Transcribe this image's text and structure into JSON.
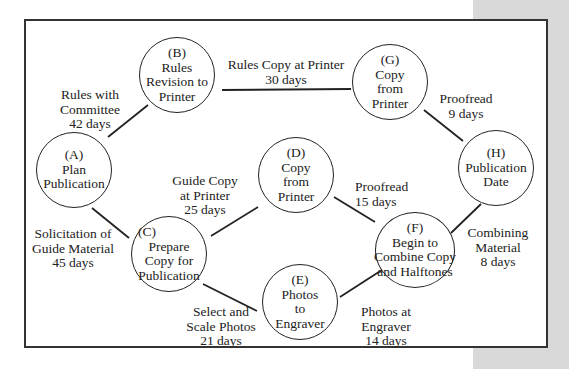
{
  "colors": {
    "line": "#222222",
    "panel": "#d9d9d9",
    "background": "#ffffff"
  },
  "nodes": [
    {
      "id": "A",
      "lines": [
        "(A)",
        "Plan",
        "Publication"
      ],
      "cx": 74,
      "cy": 170
    },
    {
      "id": "B",
      "lines": [
        "(B)",
        "Rules",
        "Revision to",
        "Printer"
      ],
      "cx": 177,
      "cy": 75
    },
    {
      "id": "C",
      "lines": [
        "(C)",
        "Prepare",
        "Copy for",
        "Publication"
      ],
      "cx": 169,
      "cy": 254
    },
    {
      "id": "D",
      "lines": [
        "(D)",
        "Copy",
        "from",
        "Printer"
      ],
      "cx": 296,
      "cy": 175
    },
    {
      "id": "E",
      "lines": [
        "(E)",
        "Photos",
        "to",
        "Engraver"
      ],
      "cx": 300,
      "cy": 302
    },
    {
      "id": "F",
      "lines": [
        "(F)",
        "Begin to",
        "Combine Copy",
        "and Halftones"
      ],
      "cx": 414,
      "cy": 250
    },
    {
      "id": "G",
      "lines": [
        "(G)",
        "Copy",
        "from",
        "Printer"
      ],
      "cx": 390,
      "cy": 82
    },
    {
      "id": "H",
      "lines": [
        "(H)",
        "Publication",
        "Date"
      ],
      "cx": 496,
      "cy": 168
    }
  ],
  "edges": [
    {
      "from": "A",
      "to": "B",
      "activity": [
        "Rules with",
        "Committee"
      ],
      "duration": "42 days"
    },
    {
      "from": "B",
      "to": "G",
      "activity": [
        "Rules Copy at Printer"
      ],
      "duration": "30 days"
    },
    {
      "from": "G",
      "to": "H",
      "activity": [
        "Proofread"
      ],
      "duration": "9 days"
    },
    {
      "from": "A",
      "to": "C",
      "activity": [
        "Solicitation of",
        "Guide Material"
      ],
      "duration": "45 days"
    },
    {
      "from": "C",
      "to": "D",
      "activity": [
        "Guide Copy",
        "at Printer"
      ],
      "duration": "25 days"
    },
    {
      "from": "D",
      "to": "F",
      "activity": [
        "Proofread"
      ],
      "duration": "15 days"
    },
    {
      "from": "C",
      "to": "E",
      "activity": [
        "Select and",
        "Scale Photos"
      ],
      "duration": "21 days"
    },
    {
      "from": "E",
      "to": "F",
      "activity": [
        "Photos at",
        "Engraver"
      ],
      "duration": "14 days"
    },
    {
      "from": "F",
      "to": "H",
      "activity": [
        "Combining",
        "Material"
      ],
      "duration": "8 days"
    }
  ]
}
